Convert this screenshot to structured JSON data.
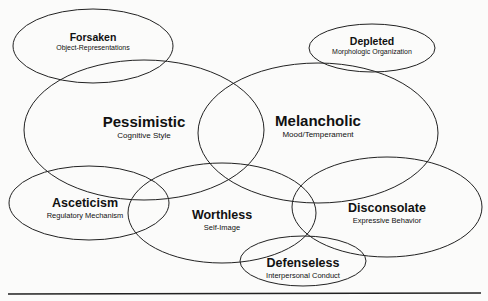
{
  "diagram": {
    "type": "overlapping-ellipses",
    "nodes": [
      {
        "id": "forsaken",
        "title": "Forsaken",
        "subtitle": "Object-Representations",
        "cx": 93,
        "cy": 46,
        "rx": 80,
        "ry": 37,
        "label_x": 93,
        "label_y": 42,
        "size": "sm"
      },
      {
        "id": "depleted",
        "title": "Depleted",
        "subtitle": "Morphologic Organization",
        "cx": 372,
        "cy": 48,
        "rx": 63,
        "ry": 24,
        "label_x": 372,
        "label_y": 46,
        "size": "sm"
      },
      {
        "id": "pessimistic",
        "title": "Pessimistic",
        "subtitle": "Cognitive Style",
        "cx": 144,
        "cy": 130,
        "rx": 120,
        "ry": 70,
        "label_x": 144,
        "label_y": 127,
        "size": "lg"
      },
      {
        "id": "melancholic",
        "title": "Melancholic",
        "subtitle": "Mood/Temperament",
        "cx": 318,
        "cy": 133,
        "rx": 120,
        "ry": 70,
        "label_x": 318,
        "label_y": 126,
        "size": "lg"
      },
      {
        "id": "asceticism",
        "title": "Asceticism",
        "subtitle": "Regulatory Mechanism",
        "cx": 89,
        "cy": 203,
        "rx": 80,
        "ry": 37,
        "label_x": 85,
        "label_y": 208,
        "size": "md"
      },
      {
        "id": "worthless",
        "title": "Worthless",
        "subtitle": "Self-Image",
        "cx": 222,
        "cy": 213,
        "rx": 94,
        "ry": 50,
        "label_x": 222,
        "label_y": 220,
        "size": "md"
      },
      {
        "id": "disconsolate",
        "title": "Disconsolate",
        "subtitle": "Expressive Behavior",
        "cx": 387,
        "cy": 207,
        "rx": 95,
        "ry": 50,
        "label_x": 387,
        "label_y": 213,
        "size": "md"
      },
      {
        "id": "defenseless",
        "title": "Defenseless",
        "subtitle": "Interpersonal Conduct",
        "cx": 303,
        "cy": 261,
        "rx": 63,
        "ry": 25,
        "label_x": 303,
        "label_y": 268,
        "size": "md"
      }
    ],
    "rule": {
      "x1": 8,
      "y1": 294,
      "x2": 481,
      "y2": 293
    }
  }
}
